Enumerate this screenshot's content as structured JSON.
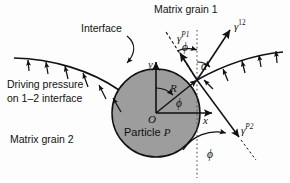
{
  "figure": {
    "type": "schematic-diagram",
    "width": 290,
    "height": 183
  },
  "labels": {
    "matrix_grain_1": "Matrix grain 1",
    "matrix_grain_2": "Matrix grain 2",
    "interface": "Interface",
    "driving_pressure_line1": "Driving pressure",
    "driving_pressure_line2": "on 1–2 interface",
    "particle": "Particle",
    "particle_symbol": "P"
  },
  "vectors": {
    "gamma_p1": {
      "base": "γ",
      "sup": "P1"
    },
    "gamma_12": {
      "base": "γ",
      "sup": "12"
    },
    "gamma_p2": {
      "base": "γ",
      "sup": "P2"
    }
  },
  "axes": {
    "x": "x",
    "y": "y",
    "origin": "O",
    "radius": "R"
  },
  "angles": {
    "phi_upper": "ϕ",
    "alpha": "α",
    "phi_interior": "ϕ",
    "phi_lower": "ϕ"
  },
  "colors": {
    "particle_fill": "#9d9d9d",
    "stroke": "#111111",
    "background": "#fdfdfd"
  },
  "geometry": {
    "circle_center_x": 156,
    "circle_center_y": 113,
    "circle_radius": 44,
    "junction_x": 197,
    "junction_y": 80
  }
}
